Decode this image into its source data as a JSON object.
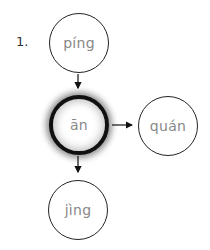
{
  "diagram": {
    "number_label": "1.",
    "nodes": {
      "top": {
        "label": "píng"
      },
      "center": {
        "label": "ān"
      },
      "right": {
        "label": "quán"
      },
      "bottom": {
        "label": "jìng"
      }
    },
    "edges": [
      {
        "from": "top",
        "to": "center"
      },
      {
        "from": "center",
        "to": "right"
      },
      {
        "from": "center",
        "to": "bottom"
      }
    ],
    "colors": {
      "outline": "#222222",
      "text": "#888888",
      "highlight_border": "#111111"
    }
  }
}
